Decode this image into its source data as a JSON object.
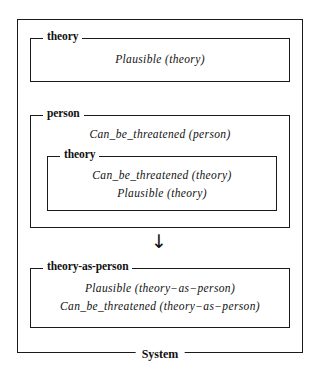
{
  "diagram": {
    "title_label": "System",
    "arrow_glyph": "↓",
    "accent_color": "#111111",
    "background_color": "#ffffff",
    "boxes": [
      {
        "name": "theory-top",
        "label": "theory",
        "formulas": [
          {
            "fn": "Plausible",
            "args": "(theory)",
            "text": "Plausible (theory)"
          }
        ]
      },
      {
        "name": "person",
        "label": "person",
        "formulas": [
          {
            "fn": "Can_be_threatened",
            "args": "(person)",
            "text": "Can_be_threatened (person)"
          }
        ]
      },
      {
        "name": "theory-inner",
        "label": "theory",
        "formulas": [
          {
            "fn": "Can_be_threatened",
            "args": "(theory)",
            "text": "Can_be_threatened (theory)"
          },
          {
            "fn": "Plausible",
            "args": "(theory)",
            "text": "Plausible (theory)"
          }
        ]
      },
      {
        "name": "theory-as-person",
        "label": "theory-as-person",
        "formulas": [
          {
            "fn": "Plausible",
            "args": "(theory−as−person)",
            "text": "Plausible (theory−as−person)"
          },
          {
            "fn": "Can_be_threatened",
            "args": "(theory−as−person)",
            "text": "Can_be_threatened (theory−as−person)"
          }
        ]
      }
    ]
  }
}
